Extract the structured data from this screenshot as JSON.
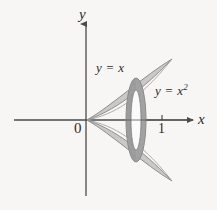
{
  "figure": {
    "name": "solid-of-revolution-washer",
    "background_color": "#f8f6f4",
    "axes": {
      "x_axis_label": "x",
      "y_axis_label": "y",
      "origin_label": "0",
      "x_ticks": [
        {
          "label": "1",
          "value": 1
        }
      ],
      "x_axis_pixel_y": 120,
      "y_axis_pixel_x": 86
    },
    "curves": [
      {
        "id": "line",
        "label": "y = x",
        "equation": "y = x"
      },
      {
        "id": "parabola",
        "label": "y = x",
        "label_exponent": "2",
        "equation": "y = x^2"
      }
    ],
    "region": {
      "description": "region between y = x and y = x^2 on [0,1], revolved about the x-axis",
      "fill_color": "#c9c9c9",
      "stroke_color": "#8e8e8e"
    },
    "washer": {
      "description": "representative washer cross-section perpendicular to the x-axis",
      "outer_ring_color": "#a2a2a2",
      "inner_hole_color": "#fbfbfb",
      "center_x": 136,
      "center_y": 120,
      "outer_rx": 10,
      "outer_ry": 42,
      "inner_rx": 5,
      "inner_ry": 30
    },
    "colors": {
      "axis": "#4a4a4a",
      "text": "#2b2b2b",
      "region_fill": "#c9c9c9",
      "region_stroke": "#8e8e8e",
      "ring": "#a2a2a2",
      "hole": "#fbfbfb"
    }
  }
}
